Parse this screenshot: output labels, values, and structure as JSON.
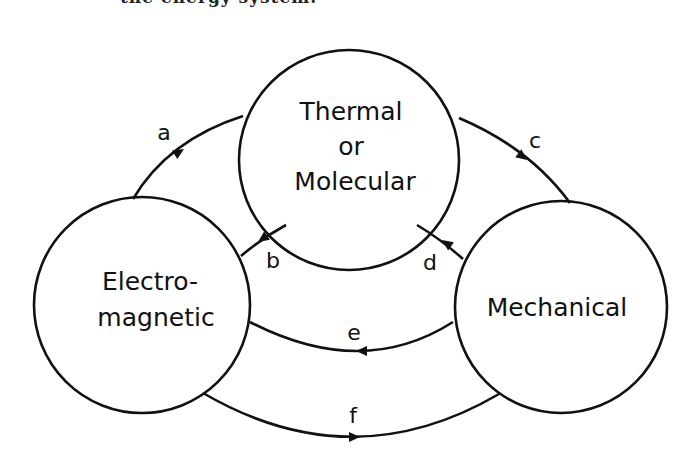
{
  "cut_text": "the energy system.",
  "diagram": {
    "nodes": [
      {
        "id": "thermal",
        "lines": [
          "Thermal",
          "or",
          "Molecular"
        ]
      },
      {
        "id": "electromagnetic",
        "lines": [
          "Electro-",
          "magnetic"
        ]
      },
      {
        "id": "mechanical",
        "lines": [
          "Mechanical"
        ]
      }
    ],
    "edges": [
      {
        "label": "a",
        "from": "electromagnetic",
        "to": "thermal"
      },
      {
        "label": "b",
        "from": "thermal",
        "to": "electromagnetic"
      },
      {
        "label": "c",
        "from": "thermal",
        "to": "mechanical"
      },
      {
        "label": "d",
        "from": "mechanical",
        "to": "thermal"
      },
      {
        "label": "e",
        "from": "mechanical",
        "to": "electromagnetic"
      },
      {
        "label": "f",
        "from": "electromagnetic",
        "to": "mechanical"
      }
    ],
    "colors": {
      "stroke": "#111111",
      "background": "#ffffff"
    }
  }
}
